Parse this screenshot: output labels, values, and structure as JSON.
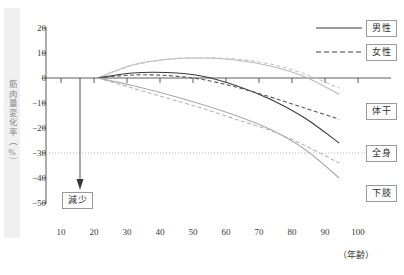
{
  "chart_data": {
    "type": "line",
    "title": "",
    "xlabel": "（年齢）",
    "ylabel": "筋肉量変化率（%）",
    "xlim": [
      5,
      105
    ],
    "ylim": [
      -50,
      20
    ],
    "xticks": [
      10,
      20,
      30,
      40,
      50,
      60,
      70,
      80,
      90,
      100
    ],
    "yticks": [
      20,
      10,
      0,
      -10,
      -20,
      -30,
      -40,
      -50
    ],
    "grid": false,
    "reference_lines": [
      {
        "axis": "y",
        "value": -20,
        "style": "dotted",
        "color": "#b0b0b0"
      }
    ],
    "annotations": [
      {
        "text": "減少",
        "x": 16,
        "y": -42,
        "arrow_from_y": 0,
        "arrow_to_y": -38,
        "boxed": true
      }
    ],
    "legend": {
      "position": "top-right",
      "entries": [
        {
          "label": "男性",
          "style": "solid"
        },
        {
          "label": "女性",
          "style": "dashed"
        }
      ]
    },
    "series_labels_right": [
      {
        "label": "体干",
        "y": -12
      },
      {
        "label": "全身",
        "y": -22
      },
      {
        "label": "下肢",
        "y": -36
      }
    ],
    "x": [
      20,
      30,
      40,
      50,
      60,
      70,
      80,
      90
    ],
    "series": [
      {
        "name": "体干・男性",
        "group": "体干",
        "sex": "男性",
        "style": "solid",
        "color": "#b9b9b9",
        "values": [
          0,
          5.2,
          7.5,
          8.0,
          7.2,
          4.8,
          0.5,
          -6.5
        ]
      },
      {
        "name": "体干・女性",
        "group": "体干",
        "sex": "女性",
        "style": "dashed",
        "color": "#c6c6c6",
        "values": [
          0,
          5.0,
          7.4,
          8.1,
          7.6,
          5.6,
          1.6,
          -4.0
        ]
      },
      {
        "name": "全身・男性",
        "group": "全身",
        "sex": "男性",
        "style": "solid",
        "color": "#3a3a3a",
        "values": [
          0,
          2.0,
          2.2,
          0.8,
          -3.0,
          -8.5,
          -16.0,
          -26.0
        ]
      },
      {
        "name": "全身・女性",
        "group": "全身",
        "sex": "女性",
        "style": "dashed",
        "color": "#565656",
        "values": [
          0,
          1.2,
          1.0,
          -0.5,
          -3.6,
          -7.6,
          -12.0,
          -16.5
        ]
      },
      {
        "name": "下肢・男性",
        "group": "下肢",
        "sex": "男性",
        "style": "solid",
        "color": "#a9a9a9",
        "values": [
          0,
          -3.0,
          -6.5,
          -10.5,
          -15.0,
          -20.5,
          -28.5,
          -40.0
        ]
      },
      {
        "name": "下肢・女性",
        "group": "下肢",
        "sex": "女性",
        "style": "dashed",
        "color": "#b5b5b5",
        "values": [
          0,
          -4.0,
          -8.0,
          -12.0,
          -16.5,
          -21.0,
          -27.0,
          -34.0
        ]
      }
    ]
  },
  "ylabel": {
    "text": "筋肉量変化率（%）"
  },
  "xaxis": {
    "caption": "（年齢）",
    "ticks": [
      "10",
      "20",
      "30",
      "40",
      "50",
      "60",
      "70",
      "80",
      "90",
      "100"
    ]
  },
  "yaxis": {
    "ticks": [
      "20",
      "10",
      "0",
      "−10",
      "−20",
      "−30",
      "−40",
      "−50"
    ]
  },
  "legend": {
    "male_label": "男性",
    "female_label": "女性"
  },
  "series_labels": {
    "trunk": "体干",
    "whole_body": "全身",
    "lower_limbs": "下肢"
  },
  "annotation": {
    "decrease_label": "減少"
  }
}
